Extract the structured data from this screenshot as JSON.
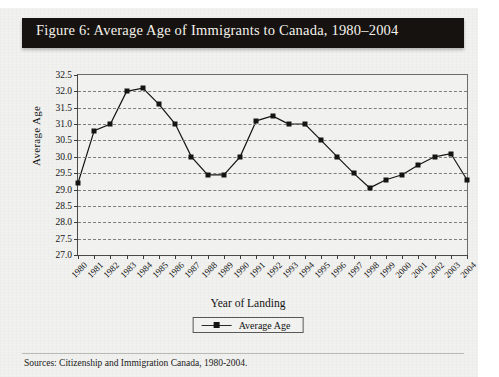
{
  "figure": {
    "title": "Figure 6: Average Age of Immigrants to Canada, 1980–2004",
    "source": "Sources: Citizenship and Immigration Canada, 1980-2004."
  },
  "chart_data": {
    "type": "line",
    "title": "Figure 6: Average Age of Immigrants to Canada, 1980–2004",
    "xlabel": "Year of Landing",
    "ylabel": "Average Age",
    "ylim": [
      27.0,
      32.5
    ],
    "ytick_labels": [
      "32.5",
      "32.0",
      "31.5",
      "31.0",
      "30.5",
      "30.0",
      "29.5",
      "29.0",
      "28.5",
      "28.0",
      "27.5",
      "27.0"
    ],
    "ytick_values": [
      32.5,
      32.0,
      31.5,
      31.0,
      30.5,
      30.0,
      29.5,
      29.0,
      28.5,
      28.0,
      27.5,
      27.0
    ],
    "grid": true,
    "legend_position": "bottom-center",
    "categories": [
      "1980",
      "1981",
      "1982",
      "1983",
      "1984",
      "1985",
      "1986",
      "1987",
      "1988",
      "1989",
      "1990",
      "1991",
      "1992",
      "1993",
      "1994",
      "1995",
      "1996",
      "1997",
      "1998",
      "1999",
      "2000",
      "2001",
      "2002",
      "2003",
      "2004"
    ],
    "series": [
      {
        "name": "Average Age",
        "marker": "square",
        "color": "#141414",
        "values": [
          29.2,
          30.8,
          31.0,
          32.0,
          32.1,
          31.6,
          31.0,
          30.0,
          29.45,
          29.45,
          30.0,
          31.1,
          31.25,
          31.0,
          31.0,
          30.5,
          30.0,
          29.5,
          29.05,
          29.3,
          29.45,
          29.75,
          30.0,
          30.1,
          29.3
        ]
      }
    ]
  },
  "colors": {
    "banner_bg": "#15120f",
    "banner_text": "#f4f1ec",
    "page_bg": "#f1f1ef",
    "line": "#141414",
    "grid": "#7d7d7d"
  }
}
